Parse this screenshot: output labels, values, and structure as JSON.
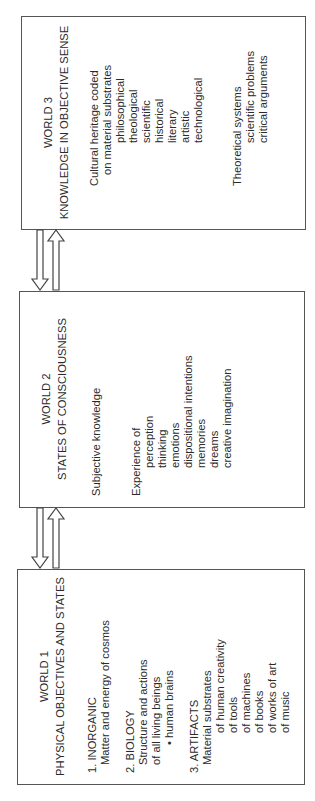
{
  "diagram": {
    "orientation": "rotated-90-ccw",
    "border_color": "#555555",
    "text_color": "#2a2a2a",
    "worlds": [
      {
        "id": "world3",
        "title": "WORLD 3",
        "subtitle": "KNOWLEDGE IN OBJECTIVE SENSE",
        "lines": [
          {
            "text": "Cultural heritage coded",
            "indent": 0
          },
          {
            "text": "on material substrates",
            "indent": 1
          },
          {
            "text": "philosophical",
            "indent": 2
          },
          {
            "text": "theological",
            "indent": 2
          },
          {
            "text": "scientific",
            "indent": 2
          },
          {
            "text": "historical",
            "indent": 2
          },
          {
            "text": "literary",
            "indent": 2
          },
          {
            "text": "artistic",
            "indent": 2
          },
          {
            "text": "technological",
            "indent": 2
          },
          {
            "text": "",
            "indent": 0
          },
          {
            "text": "Theoretical systems",
            "indent": 0
          },
          {
            "text": "scientific problems",
            "indent": 2
          },
          {
            "text": "critical arguments",
            "indent": 2
          }
        ]
      },
      {
        "id": "world2",
        "title": "WORLD 2",
        "subtitle": "STATES OF CONSCIOUSNESS",
        "lines": [
          {
            "text": "Subjective knowledge",
            "indent": 0
          },
          {
            "text": "",
            "indent": 0
          },
          {
            "text": "",
            "indent": 0
          },
          {
            "text": "Experience of",
            "indent": 0
          },
          {
            "text": "perception",
            "indent": 2
          },
          {
            "text": "thinking",
            "indent": 2
          },
          {
            "text": "emotions",
            "indent": 2
          },
          {
            "text": "dispositional intentions",
            "indent": 2
          },
          {
            "text": "memories",
            "indent": 2
          },
          {
            "text": "dreams",
            "indent": 2
          },
          {
            "text": "creative imagination",
            "indent": 2
          }
        ]
      },
      {
        "id": "world1",
        "title": "WORLD 1",
        "subtitle": "PHYSICAL OBJECTIVES AND STATES",
        "lines": [
          {
            "text": "1. INORGANIC",
            "indent": 0
          },
          {
            "text": "Matter and energy of cosmos",
            "indent": 1
          },
          {
            "text": "",
            "indent": 0
          },
          {
            "text": "2. BIOLOGY",
            "indent": 0
          },
          {
            "text": "Structure and actions",
            "indent": 1
          },
          {
            "text": "of all living beings",
            "indent": 1
          },
          {
            "text": "• human brains",
            "indent": 3
          },
          {
            "text": "",
            "indent": 0
          },
          {
            "text": "3. ARTIFACTS",
            "indent": 0
          },
          {
            "text": "Material substrates",
            "indent": 1
          },
          {
            "text": "of human creativity",
            "indent": 4
          },
          {
            "text": "of tools",
            "indent": 4
          },
          {
            "text": "of machines",
            "indent": 4
          },
          {
            "text": "of books",
            "indent": 4
          },
          {
            "text": "of works of art",
            "indent": 4
          },
          {
            "text": "of music",
            "indent": 4
          }
        ]
      }
    ],
    "connectors": [
      {
        "between": [
          "world3",
          "world2"
        ],
        "arrows": [
          "down",
          "up"
        ]
      },
      {
        "between": [
          "world2",
          "world1"
        ],
        "arrows": [
          "down",
          "up"
        ]
      }
    ]
  }
}
